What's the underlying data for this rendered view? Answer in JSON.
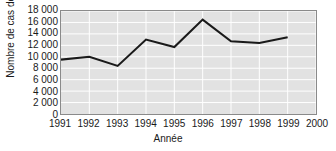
{
  "chart_data": {
    "type": "line",
    "title": "",
    "xlabel": "Année",
    "ylabel": "Nombre de cas déclarés",
    "x": [
      1991,
      1992,
      1993,
      1994,
      1995,
      1996,
      1997,
      1998,
      1999
    ],
    "values": [
      9500,
      10000,
      8400,
      13000,
      11700,
      16500,
      12700,
      12400,
      13400
    ],
    "series": [
      {
        "name": "Nombre de cas déclarés",
        "values": [
          9500,
          10000,
          8400,
          13000,
          11700,
          16500,
          12700,
          12400,
          13400
        ],
        "color": "#1a1a1a"
      }
    ],
    "xlim": [
      1991,
      2000
    ],
    "ylim": [
      0,
      18000
    ],
    "xticks": [
      1991,
      1992,
      1993,
      1994,
      1995,
      1996,
      1997,
      1998,
      1999,
      2000
    ],
    "xtick_labels": [
      "1991",
      "1992",
      "1993",
      "1994",
      "1995",
      "1996",
      "1997",
      "1998",
      "1999",
      "2000"
    ],
    "yticks": [
      0,
      2000,
      4000,
      6000,
      8000,
      10000,
      12000,
      14000,
      16000,
      18000
    ],
    "ytick_labels": [
      "0",
      "2 000",
      "4 000",
      "6 000",
      "8 000",
      "10 000",
      "12 000",
      "14 000",
      "16 000",
      "18 000"
    ],
    "grid": true,
    "grid_color": "#ffffff",
    "plot_background": "#e2e2e2",
    "border_color": "#8a8a8a",
    "legend": null,
    "legend_position": "none"
  }
}
